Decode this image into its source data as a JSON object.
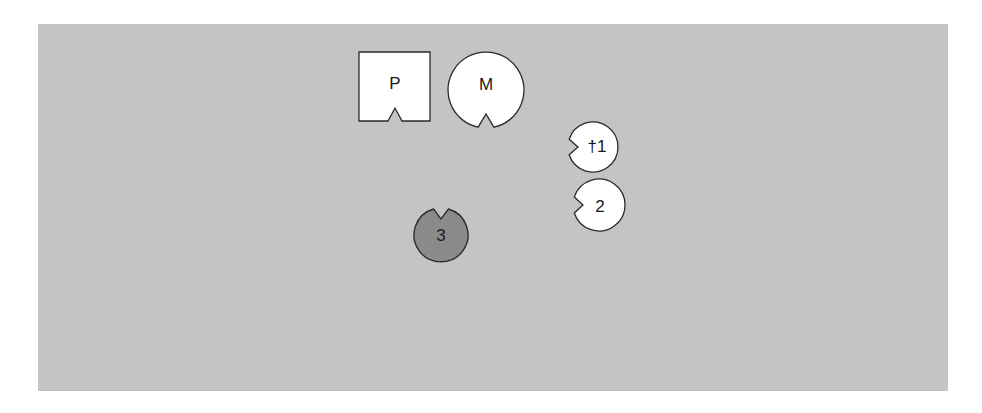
{
  "diagram": {
    "colors": {
      "background": "#c4c4c4",
      "shape_fill": "#ffffff",
      "shape_fill_dark": "#8a8a8a",
      "stroke": "#2a2a2a"
    },
    "shapes": [
      {
        "id": "P",
        "label": "P",
        "shape": "square-notched",
        "fill": "white",
        "notch": "bottom"
      },
      {
        "id": "M",
        "label": "M",
        "shape": "circle-notched",
        "fill": "white",
        "notch": "bottom"
      },
      {
        "id": "1",
        "label": "†1",
        "shape": "circle-notched",
        "fill": "white",
        "notch": "left"
      },
      {
        "id": "2",
        "label": "2",
        "shape": "circle-notched",
        "fill": "white",
        "notch": "left"
      },
      {
        "id": "3",
        "label": "3",
        "shape": "circle-notched",
        "fill": "dark",
        "notch": "top"
      }
    ]
  }
}
